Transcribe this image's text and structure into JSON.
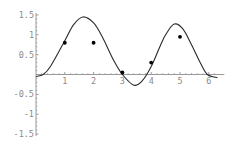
{
  "chart_data": {
    "type": "scatter",
    "title": "",
    "xlabel": "",
    "ylabel": "",
    "xlim": [
      0,
      6.4
    ],
    "ylim": [
      -1.5,
      1.5
    ],
    "grid": false,
    "legend": null,
    "x_ticks": [
      "1",
      "2",
      "3",
      "4",
      "5",
      "6"
    ],
    "y_ticks": [
      "1.5",
      "1",
      "0.5",
      "-0.5",
      "-1",
      "-1.5"
    ],
    "series": [
      {
        "name": "data points",
        "kind": "scatter",
        "x": [
          1,
          2,
          3,
          4,
          5
        ],
        "y": [
          0.8,
          0.8,
          0.05,
          0.3,
          0.95
        ]
      },
      {
        "name": "fitted curve",
        "kind": "line",
        "x": [
          0,
          0.25,
          0.5,
          1,
          1.3,
          1.63,
          2,
          2.3,
          2.7,
          3,
          3.4,
          3.7,
          4,
          4.3,
          4.5,
          4.8,
          5.1,
          5.4,
          5.7,
          5.95,
          6.3
        ],
        "y": [
          -0.05,
          0,
          0.2,
          0.85,
          1.25,
          1.45,
          1.3,
          0.95,
          0.35,
          0,
          -0.27,
          -0.15,
          0.2,
          0.7,
          1.0,
          1.27,
          1.15,
          0.75,
          0.3,
          0,
          -0.08
        ]
      }
    ]
  },
  "colors": {
    "axis": "#9a9a9a",
    "tick_label": "#8a8a8a",
    "curve": "#2a2a2a",
    "points": "#000000"
  }
}
